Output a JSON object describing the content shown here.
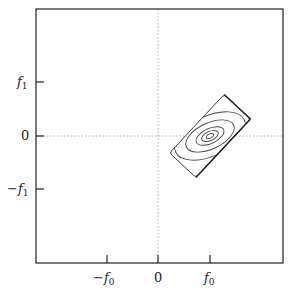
{
  "figure": {
    "x_ticks": [
      {
        "label": "−f",
        "sub": "0",
        "pos": -1
      },
      {
        "label": "0",
        "sub": "",
        "pos": 0
      },
      {
        "label": "f",
        "sub": "0",
        "pos": 1
      }
    ],
    "y_ticks": [
      {
        "label": "f",
        "sub": "1",
        "pos": 1
      },
      {
        "label": "0",
        "sub": "",
        "pos": 0
      },
      {
        "label": "−f",
        "sub": "1",
        "pos": -1
      }
    ],
    "x_tick_labels": {
      "neg": "−f",
      "neg_sub": "0",
      "zero": "0",
      "pos": "f",
      "pos_sub": "0"
    },
    "y_tick_labels": {
      "pos": "f",
      "pos_sub": "1",
      "zero": "0",
      "neg": "−f",
      "neg_sub": "1"
    },
    "colors": {
      "frame": "#222222",
      "contour": "#444444",
      "axis_dotted": "#999999"
    }
  }
}
